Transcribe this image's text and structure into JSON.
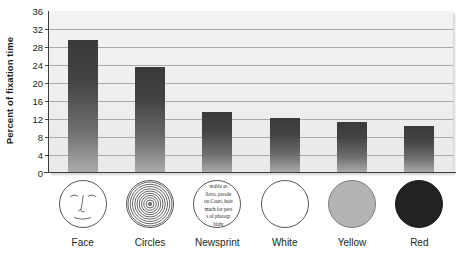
{
  "chart_data": {
    "type": "bar",
    "title": "",
    "xlabel": "",
    "ylabel": "Percent of fixation time",
    "ylim": [
      0,
      36
    ],
    "ytick_step": 4,
    "yticks": [
      "36",
      "32",
      "28",
      "24",
      "20",
      "16",
      "12",
      "8",
      "4",
      "0"
    ],
    "grid": true,
    "legend": "none",
    "categories": [
      "Face",
      "Circles",
      "Newsprint",
      "White",
      "Yellow",
      "Red"
    ],
    "values": [
      29.5,
      23.5,
      13.5,
      12.2,
      11.4,
      10.4
    ]
  },
  "axis": {
    "y_title": "Percent of fixation time"
  },
  "symbols": [
    {
      "name": "face",
      "kind": "face-drawing",
      "label": "Face"
    },
    {
      "name": "circles",
      "kind": "concentric-circles",
      "label": "Circles"
    },
    {
      "name": "newsprint",
      "kind": "newsprint-text",
      "label": "Newsprint"
    },
    {
      "name": "white",
      "kind": "plain-outline",
      "label": "White"
    },
    {
      "name": "yellow",
      "kind": "filled-gray",
      "label": "Yellow"
    },
    {
      "name": "red",
      "kind": "filled-dark",
      "label": "Red"
    }
  ],
  "newsprint_lines": [
    "ntable as",
    "llova, parade",
    "tre Court, hois",
    "much for pers",
    "s of photogr",
    "blahr"
  ],
  "colors": {
    "plot_background": "#eeeeee",
    "gridline": "#a9a9a9",
    "axis": "#3d3d3d",
    "bar_top": "#3a3a3a",
    "bar_bottom": "#ababab",
    "text": "#231f20",
    "symbol_white": "#ffffff",
    "symbol_yellow": "#b4b4b4",
    "symbol_red": "#222124"
  }
}
